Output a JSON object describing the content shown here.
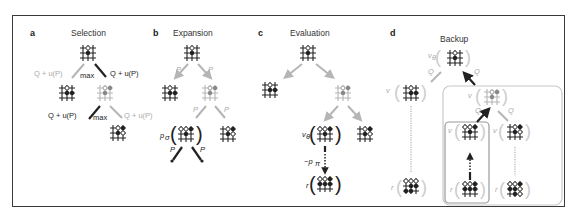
{
  "figure": {
    "panels": [
      {
        "letter": "a",
        "title": "Selection"
      },
      {
        "letter": "b",
        "title": "Expansion"
      },
      {
        "letter": "c",
        "title": "Evaluation"
      },
      {
        "letter": "d",
        "title": "Backup"
      }
    ],
    "selection": {
      "edge_label": "Q + u(P)",
      "max_label": "max"
    },
    "expansion": {
      "edge_label": "P",
      "policy_label": "p",
      "policy_sub": "σ"
    },
    "evaluation": {
      "value_label": "v",
      "value_sub": "θ",
      "rollout_label": "~p",
      "rollout_sub": "π",
      "reward_label": "r"
    },
    "backup": {
      "edge_label": "Q",
      "value_label": "v",
      "value_sub": "θ",
      "reward_label": "r"
    },
    "colors": {
      "highlight": "#222222",
      "faded": "#b5b5b5",
      "frame": "#3a3a3a",
      "box": "#c8c8c8"
    }
  }
}
